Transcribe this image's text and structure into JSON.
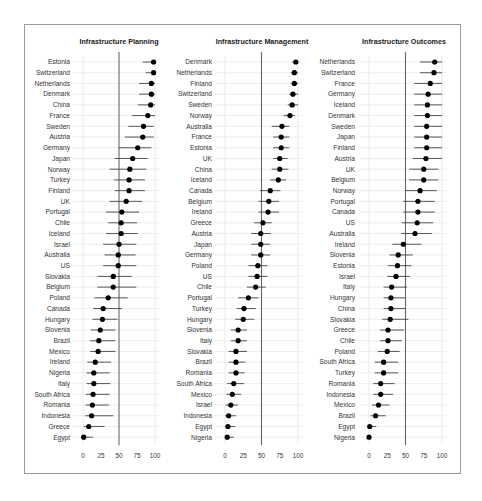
{
  "chart_data": [
    {
      "type": "scatter",
      "subtype": "dot-plot with confidence intervals",
      "title": "Infrastructure Planning",
      "xlabel": "",
      "ylabel": "",
      "xlim": [
        0,
        100
      ],
      "xticks": [
        0,
        25,
        50,
        75,
        100
      ],
      "reference_line": 50,
      "grid": true,
      "categories": [
        "Estonia",
        "Switzerland",
        "Netherlands",
        "Denmark",
        "China",
        "France",
        "Sweden",
        "Austria",
        "Germany",
        "Japan",
        "Norway",
        "Turkey",
        "Finland",
        "UK",
        "Portugal",
        "Chile",
        "Iceland",
        "Israel",
        "Australia",
        "US",
        "Slovakia",
        "Belgium",
        "Poland",
        "Canada",
        "Hungary",
        "Slovenia",
        "Brazil",
        "Mexico",
        "Ireland",
        "Nigeria",
        "Italy",
        "South Africa",
        "Romania",
        "Indonesia",
        "Greece",
        "Egypt"
      ],
      "values": [
        98,
        98,
        95,
        95,
        94,
        90,
        84,
        83,
        76,
        69,
        65,
        64,
        64,
        60,
        54,
        53,
        53,
        50,
        49,
        49,
        42,
        42,
        35,
        28,
        27,
        24,
        22,
        21,
        17,
        15,
        15,
        14,
        13,
        12,
        8,
        1
      ],
      "ci_low": [
        83,
        87,
        78,
        78,
        76,
        68,
        63,
        58,
        50,
        44,
        37,
        43,
        44,
        37,
        32,
        35,
        32,
        28,
        30,
        28,
        20,
        20,
        16,
        14,
        13,
        11,
        10,
        10,
        6,
        5,
        5,
        4,
        4,
        3,
        1,
        0
      ],
      "ci_high": [
        100,
        100,
        100,
        100,
        100,
        100,
        98,
        98,
        95,
        90,
        88,
        86,
        86,
        82,
        78,
        75,
        76,
        74,
        73,
        74,
        68,
        74,
        62,
        54,
        48,
        45,
        45,
        45,
        39,
        37,
        38,
        37,
        36,
        42,
        30,
        14
      ]
    },
    {
      "type": "scatter",
      "subtype": "dot-plot with confidence intervals",
      "title": "Infrastructure Management",
      "xlabel": "",
      "ylabel": "",
      "xlim": [
        0,
        100
      ],
      "xticks": [
        0,
        25,
        50,
        75,
        100
      ],
      "reference_line": 50,
      "grid": true,
      "categories": [
        "Denmark",
        "Netherlands",
        "Finland",
        "Switzerland",
        "Sweden",
        "Norway",
        "Australia",
        "France",
        "Estonia",
        "UK",
        "China",
        "Iceland",
        "Canada",
        "Belgium",
        "Ireland",
        "Greece",
        "Austria",
        "Japan",
        "Germany",
        "Poland",
        "US",
        "Chile",
        "Portugal",
        "Turkey",
        "Hungary",
        "Slovenia",
        "Italy",
        "Slovakia",
        "Brazil",
        "Romania",
        "South Africa",
        "Mexico",
        "Israel",
        "Indonesia",
        "Egypt",
        "Nigeria"
      ],
      "values": [
        97,
        95,
        95,
        93,
        92,
        89,
        78,
        77,
        77,
        75,
        75,
        73,
        62,
        60,
        59,
        52,
        49,
        49,
        49,
        45,
        44,
        42,
        32,
        26,
        25,
        18,
        18,
        15,
        15,
        15,
        12,
        10,
        8,
        5,
        4,
        3
      ],
      "ci_low": [
        92,
        90,
        90,
        88,
        86,
        80,
        64,
        66,
        66,
        66,
        64,
        62,
        48,
        46,
        46,
        40,
        36,
        36,
        36,
        32,
        32,
        30,
        18,
        16,
        14,
        8,
        8,
        5,
        5,
        5,
        3,
        2,
        1,
        0,
        0,
        0
      ],
      "ci_high": [
        100,
        100,
        100,
        100,
        100,
        96,
        88,
        88,
        88,
        86,
        87,
        84,
        76,
        74,
        74,
        64,
        63,
        62,
        62,
        58,
        58,
        56,
        46,
        42,
        40,
        30,
        30,
        30,
        28,
        27,
        26,
        22,
        18,
        15,
        14,
        12
      ]
    },
    {
      "type": "scatter",
      "subtype": "dot-plot with confidence intervals",
      "title": "Infrastructure Outcomes",
      "xlabel": "",
      "ylabel": "",
      "xlim": [
        0,
        100
      ],
      "xticks": [
        0,
        25,
        50,
        75,
        100
      ],
      "reference_line": 50,
      "grid": true,
      "categories": [
        "Netherlands",
        "Switzerland",
        "France",
        "Germany",
        "Iceland",
        "Denmark",
        "Sweden",
        "Japan",
        "Finland",
        "Austria",
        "UK",
        "Belgium",
        "Norway",
        "Portugal",
        "Canada",
        "US",
        "Australia",
        "Ireland",
        "Slovenia",
        "Estonia",
        "Israel",
        "Italy",
        "Hungary",
        "China",
        "Slovakia",
        "Greece",
        "Chile",
        "Poland",
        "South Africa",
        "Turkey",
        "Romania",
        "Indonesia",
        "Mexico",
        "Brazil",
        "Egypt",
        "Nigeria"
      ],
      "values": [
        90,
        89,
        84,
        81,
        80,
        80,
        79,
        79,
        79,
        78,
        75,
        75,
        70,
        67,
        67,
        66,
        63,
        47,
        40,
        39,
        37,
        31,
        30,
        30,
        29,
        26,
        26,
        25,
        20,
        20,
        16,
        16,
        13,
        9,
        1,
        0
      ],
      "ci_low": [
        70,
        70,
        62,
        62,
        62,
        62,
        62,
        62,
        62,
        60,
        55,
        55,
        50,
        47,
        47,
        45,
        44,
        32,
        28,
        26,
        25,
        20,
        20,
        20,
        18,
        15,
        15,
        12,
        8,
        8,
        6,
        6,
        4,
        2,
        0,
        0
      ],
      "ci_high": [
        100,
        100,
        100,
        100,
        100,
        100,
        100,
        100,
        100,
        100,
        95,
        95,
        93,
        90,
        90,
        88,
        86,
        72,
        60,
        58,
        56,
        52,
        50,
        50,
        54,
        48,
        45,
        42,
        40,
        40,
        35,
        33,
        28,
        23,
        10,
        2
      ]
    }
  ]
}
